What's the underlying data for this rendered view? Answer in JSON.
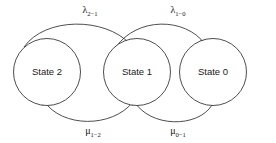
{
  "diagram": {
    "type": "markov-chain-state-transition-diagram",
    "background_color": "#ffffff",
    "stroke_color": "#3a3a3a",
    "text_color": "#151515",
    "states": [
      {
        "id": "state-2",
        "label": "State 2",
        "cx": 47,
        "cy": 72,
        "r": 33.5
      },
      {
        "id": "state-1",
        "label": "State 1",
        "cx": 137,
        "cy": 72,
        "r": 33.5
      },
      {
        "id": "state-0",
        "label": "State 0",
        "cx": 213,
        "cy": 72,
        "r": 33.5
      }
    ],
    "transitions": [
      {
        "id": "lambda-2-1",
        "from": "State 2",
        "to": "State 1",
        "symbol": "λ",
        "subscript": "2−1",
        "label": "λ2−1",
        "direction": "top-rightward",
        "label_x": 90,
        "label_y": 13
      },
      {
        "id": "lambda-1-0",
        "from": "State 1",
        "to": "State 0",
        "symbol": "λ",
        "subscript": "1−0",
        "label": "λ1−0",
        "direction": "top-rightward",
        "label_x": 178,
        "label_y": 13
      },
      {
        "id": "mu-1-2",
        "from": "State 1",
        "to": "State 2",
        "symbol": "μ",
        "subscript": "1−2",
        "label": "μ1−2",
        "direction": "bottom-leftward",
        "label_x": 93,
        "label_y": 134
      },
      {
        "id": "mu-0-1",
        "from": "State 0",
        "to": "State 1",
        "symbol": "μ",
        "subscript": "0−1",
        "label": "μ0−1",
        "direction": "bottom-leftward",
        "label_x": 178,
        "label_y": 134
      }
    ]
  }
}
